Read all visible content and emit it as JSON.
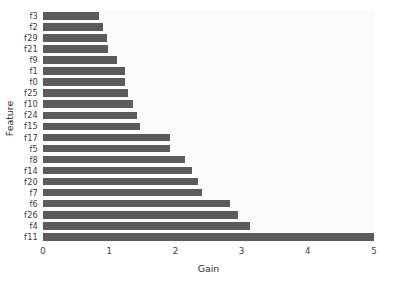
{
  "chart_data": {
    "type": "bar",
    "orientation": "horizontal",
    "title": "",
    "xlabel": "Gain",
    "ylabel": "Feature",
    "xlim": [
      0,
      5
    ],
    "xticks": [
      "0",
      "1",
      "2",
      "3",
      "4",
      "5"
    ],
    "grid": false,
    "legend": null,
    "bar_color": "#5b5b5b",
    "plot_background": "#fbfbfb",
    "figure_background": "#ffffff",
    "categories": [
      "f3",
      "f2",
      "f29",
      "f21",
      "f9",
      "f1",
      "f0",
      "f25",
      "f10",
      "f24",
      "f15",
      "f17",
      "f5",
      "f8",
      "f14",
      "f20",
      "f7",
      "f6",
      "f26",
      "f4",
      "f11"
    ],
    "values": [
      0.85,
      0.91,
      0.97,
      0.98,
      1.12,
      1.24,
      1.24,
      1.28,
      1.36,
      1.42,
      1.47,
      1.92,
      1.92,
      2.15,
      2.25,
      2.34,
      2.4,
      2.82,
      2.95,
      3.13,
      5.0
    ]
  }
}
